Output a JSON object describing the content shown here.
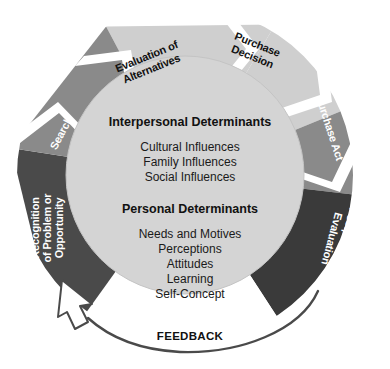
{
  "diagram": {
    "type": "circular-process-flow",
    "colors": {
      "light_gray": "#cfcfcf",
      "pale_gray": "#d9d9d9",
      "medium_gray": "#8a8a8a",
      "dark_gray": "#4a4a4a",
      "charcoal": "#3a3a3a",
      "inner_disc": "#d2d2d2",
      "background": "#ffffff",
      "text_dark": "#111111",
      "text_light": "#ffffff"
    },
    "segments": [
      {
        "id": "evaluation-of-alternatives",
        "label_lines": [
          "Evaluation of",
          "Alternatives"
        ],
        "fill": "#cfcfcf",
        "text_color": "dark"
      },
      {
        "id": "purchase-decision",
        "label_lines": [
          "Purchase",
          "Decision"
        ],
        "fill": "#cfcfcf",
        "text_color": "dark"
      },
      {
        "id": "purchase-act",
        "label_lines": [
          "Purchase Act"
        ],
        "fill": "#8a8a8a",
        "text_color": "light"
      },
      {
        "id": "postpurchase-evaluation",
        "label_lines": [
          "Postpurchase",
          "Evaluation"
        ],
        "fill": "#3a3a3a",
        "text_color": "light"
      },
      {
        "id": "recognition-of-problem-or-opportunity",
        "label_lines": [
          "Recognition",
          "of Problem or",
          "Opportunity"
        ],
        "fill": "#4a4a4a",
        "text_color": "light"
      },
      {
        "id": "search",
        "label_lines": [
          "Search"
        ],
        "fill": "#8a8a8a",
        "text_color": "light"
      }
    ],
    "center": {
      "groups": [
        {
          "id": "interpersonal-determinants",
          "heading": "Interpersonal Determinants",
          "items": [
            "Cultural Influences",
            "Family Influences",
            "Social Influences"
          ]
        },
        {
          "id": "personal-determinants",
          "heading": "Personal Determinants",
          "items": [
            "Needs and Motives",
            "Perceptions",
            "Attitudes",
            "Learning",
            "Self-Concept"
          ]
        }
      ]
    },
    "feedback": {
      "label": "FEEDBACK",
      "direction": "from postpurchase evaluation back to recognition of problem or opportunity"
    }
  }
}
